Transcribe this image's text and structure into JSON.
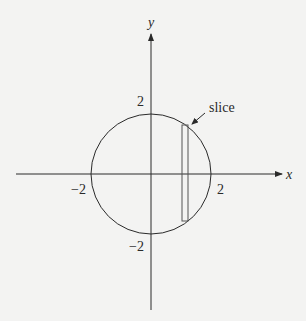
{
  "diagram": {
    "title": "",
    "axes": {
      "x_label": "x",
      "y_label": "y"
    },
    "ticks": {
      "x_pos": "2",
      "x_neg": "−2",
      "y_pos": "2",
      "y_neg": "−2"
    },
    "circle": {
      "center": [
        0,
        0
      ],
      "radius": 2
    },
    "slice": {
      "label": "slice",
      "x_left": 1.03,
      "x_right": 1.23
    },
    "colors": {
      "background": "#f3f3f2",
      "ink": "#2a2a2a",
      "slice_stroke": "#555555"
    }
  }
}
